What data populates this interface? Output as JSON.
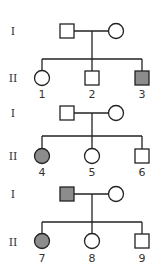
{
  "colors": {
    "affected": "#8c8c8c",
    "unaffected": "#ffffff",
    "line": "#222222"
  },
  "families": [
    {
      "generation_labels": [
        "I",
        "II"
      ],
      "parents": {
        "father": {
          "sex": "male",
          "affected": false
        },
        "mother": {
          "sex": "female",
          "affected": false
        }
      },
      "children": [
        {
          "id": "1",
          "sex": "female",
          "affected": false
        },
        {
          "id": "2",
          "sex": "male",
          "affected": false
        },
        {
          "id": "3",
          "sex": "male",
          "affected": true
        }
      ]
    },
    {
      "generation_labels": [
        "I",
        "II"
      ],
      "parents": {
        "father": {
          "sex": "male",
          "affected": false
        },
        "mother": {
          "sex": "female",
          "affected": false
        }
      },
      "children": [
        {
          "id": "4",
          "sex": "female",
          "affected": true
        },
        {
          "id": "5",
          "sex": "female",
          "affected": false
        },
        {
          "id": "6",
          "sex": "male",
          "affected": false
        }
      ]
    },
    {
      "generation_labels": [
        "I",
        "II"
      ],
      "parents": {
        "father": {
          "sex": "male",
          "affected": true
        },
        "mother": {
          "sex": "female",
          "affected": false
        }
      },
      "children": [
        {
          "id": "7",
          "sex": "female",
          "affected": true
        },
        {
          "id": "8",
          "sex": "female",
          "affected": false
        },
        {
          "id": "9",
          "sex": "male",
          "affected": false
        }
      ]
    }
  ]
}
